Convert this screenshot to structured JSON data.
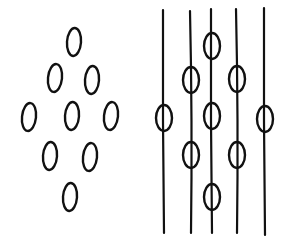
{
  "figure": {
    "stroke_color": "#111111",
    "background": "#ffffff"
  },
  "left_panel": {
    "name": "free-particles",
    "ovals": [
      {
        "cx": 74,
        "cy": 42
      },
      {
        "cx": 55,
        "cy": 78
      },
      {
        "cx": 92,
        "cy": 80
      },
      {
        "cx": 29,
        "cy": 117
      },
      {
        "cx": 72,
        "cy": 116
      },
      {
        "cx": 111,
        "cy": 116
      },
      {
        "cx": 50,
        "cy": 156
      },
      {
        "cx": 90,
        "cy": 157
      },
      {
        "cx": 70,
        "cy": 197
      }
    ],
    "rx": 7,
    "ry": 14
  },
  "right_panel": {
    "name": "threaded-particles",
    "strands": [
      {
        "x": 164,
        "y1": 10,
        "y2": 233,
        "ovals": [
          118
        ]
      },
      {
        "x": 191,
        "y1": 11,
        "y2": 233,
        "ovals": [
          80,
          155
        ]
      },
      {
        "x": 212,
        "y1": 9,
        "y2": 233,
        "ovals": [
          46,
          116,
          197
        ]
      },
      {
        "x": 237,
        "y1": 9,
        "y2": 233,
        "ovals": [
          79,
          155
        ]
      },
      {
        "x": 265,
        "y1": 8,
        "y2": 235,
        "ovals": [
          119
        ]
      }
    ],
    "rx": 8,
    "ry": 13
  }
}
